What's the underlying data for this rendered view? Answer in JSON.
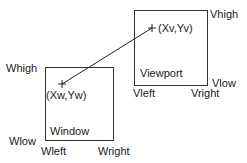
{
  "diagram": {
    "title_partial": "",
    "window": {
      "box": {
        "x": 45,
        "y": 67,
        "w": 68,
        "h": 73
      },
      "label": "Window",
      "point_label": "(Xw,Yw)",
      "point": {
        "x": 62,
        "y": 84
      },
      "high_label": "Whigh",
      "low_label": "Wlow",
      "left_label": "Wleft",
      "right_label": "Wright"
    },
    "viewport": {
      "box": {
        "x": 134,
        "y": 10,
        "w": 73,
        "h": 75
      },
      "label": "Viewport",
      "point_label": "(Xv,Yv)",
      "point": {
        "x": 152,
        "y": 28
      },
      "high_label": "Vhigh",
      "low_label": "Vlow",
      "left_label": "Vleft",
      "right_label": "Vright"
    },
    "arrow": {
      "from": "viewport.point",
      "to": "window.point"
    },
    "colors": {
      "stroke": "#333333",
      "text": "#1a1a1a",
      "background": "#ffffff"
    }
  }
}
